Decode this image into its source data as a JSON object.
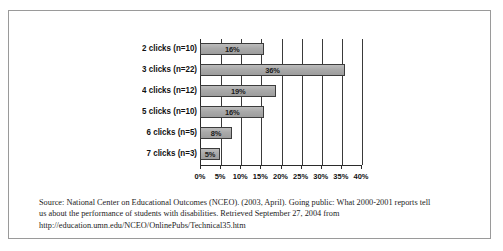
{
  "figure": {
    "caption_lines": [
      "Source: National Center on Educational Outcomes (NCEO). (2003, April). Going public: What 2000-2001 reports tell",
      "us about the performance of students with disabilities. Retrieved September 27, 2004 from",
      "http://education.umn.edu/NCEO/OnlinePubs/Technical35.htm"
    ]
  },
  "chart_data": {
    "type": "bar",
    "orientation": "horizontal",
    "title": "",
    "xlabel": "",
    "ylabel": "",
    "categories": [
      "2 clicks (n=10)",
      "3 clicks (n=22)",
      "4 clicks (n=12)",
      "5 clicks (n=10)",
      "6 clicks (n=5)",
      "7 clicks (n=3)"
    ],
    "values": [
      16,
      36,
      19,
      16,
      8,
      5
    ],
    "data_labels": [
      "16%",
      "36%",
      "19%",
      "16%",
      "8%",
      "5%"
    ],
    "xlim": [
      0,
      40
    ],
    "xticks": [
      0,
      5,
      10,
      15,
      20,
      25,
      30,
      35,
      40
    ],
    "xtick_labels": [
      "0%",
      "5%",
      "10%",
      "15%",
      "20%",
      "25%",
      "30%",
      "35%",
      "40%"
    ],
    "grid": "vertical",
    "legend": null,
    "bar_color": "#a8a8a8",
    "bar_edge_color": "#3c3c3c",
    "axis_color": "#2b2b2b"
  }
}
